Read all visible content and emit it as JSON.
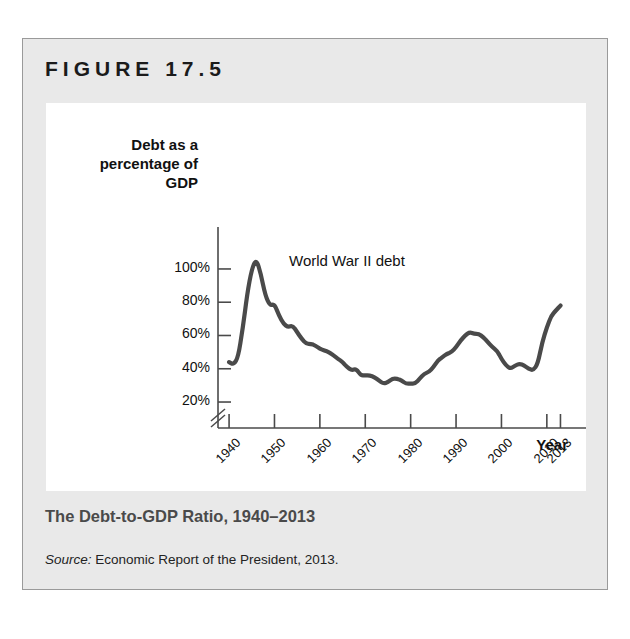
{
  "figure": {
    "label": "FIGURE 17.5",
    "caption": "The Debt-to-GDP Ratio, 1940–2013",
    "source_prefix": "Source:",
    "source_text": " Economic Report of the President, 2013."
  },
  "chart_data": {
    "type": "line",
    "title": "",
    "xlabel": "Year",
    "ylabel": "Debt as a\npercentage of\nGDP",
    "ylabel_lines": [
      "Debt as a",
      "percentage of",
      "GDP"
    ],
    "annotations": [
      {
        "text": "World War II debt",
        "x": 1951,
        "y": 103
      }
    ],
    "grid": false,
    "legend": false,
    "y_axis_break": true,
    "xlim": [
      1938,
      2014
    ],
    "ylim": [
      14,
      112
    ],
    "ytick_labels": [
      "100%",
      "80%",
      "60%",
      "40%",
      "20%"
    ],
    "ytick_values": [
      100,
      80,
      60,
      40,
      20
    ],
    "xtick_labels": [
      "1940",
      "1950",
      "1960",
      "1970",
      "1980",
      "1990",
      "2000",
      "2010",
      "2013"
    ],
    "xtick_values": [
      1940,
      1950,
      1960,
      1970,
      1980,
      1990,
      2000,
      2010,
      2013
    ],
    "series": [
      {
        "name": "Debt as a percentage of GDP",
        "color": "#4a4a4a",
        "x": [
          1940,
          1941,
          1942,
          1943,
          1944,
          1945,
          1946,
          1947,
          1948,
          1949,
          1950,
          1951,
          1952,
          1953,
          1954,
          1955,
          1956,
          1957,
          1958,
          1959,
          1960,
          1961,
          1962,
          1963,
          1964,
          1965,
          1966,
          1967,
          1968,
          1969,
          1970,
          1971,
          1972,
          1973,
          1974,
          1975,
          1976,
          1977,
          1978,
          1979,
          1980,
          1981,
          1982,
          1983,
          1984,
          1985,
          1986,
          1987,
          1988,
          1989,
          1990,
          1991,
          1992,
          1993,
          1994,
          1995,
          1996,
          1997,
          1998,
          1999,
          2000,
          2001,
          2002,
          2003,
          2004,
          2005,
          2006,
          2007,
          2008,
          2009,
          2010,
          2011,
          2012,
          2013
        ],
        "y": [
          44,
          42.5,
          47,
          64,
          85,
          100,
          106,
          97,
          84,
          78,
          79,
          72,
          67,
          65,
          66,
          62,
          58,
          55,
          55,
          54,
          52,
          51,
          50,
          48,
          46,
          44,
          41,
          39,
          40,
          36,
          36,
          36,
          35,
          33,
          31,
          32,
          34,
          34,
          33,
          31,
          31,
          31,
          34,
          37,
          38,
          41,
          45,
          47,
          49,
          50,
          53,
          57,
          60,
          62,
          61,
          61,
          59,
          56,
          53,
          51,
          46,
          42,
          40,
          42,
          43,
          42,
          40,
          39,
          43,
          56,
          65,
          72,
          75,
          78
        ],
        "y_units": "percent of GDP"
      }
    ]
  }
}
